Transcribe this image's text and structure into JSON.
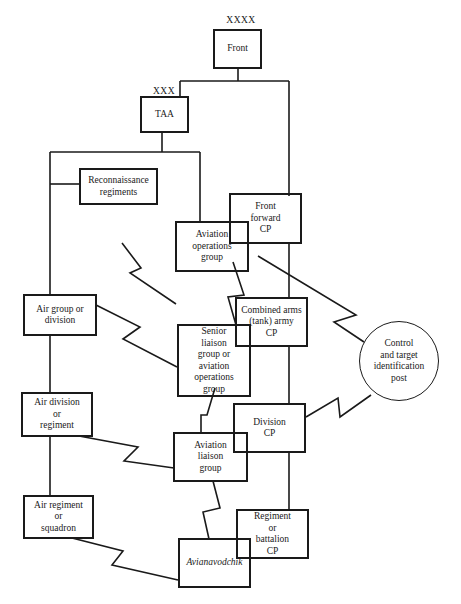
{
  "diagram": {
    "type": "organizational/communication diagram",
    "echelons": {
      "front": "XXXX",
      "taa": "XXX"
    },
    "nodes": {
      "front": "Front",
      "taa": "TAA",
      "recon": "Reconnaissance regiments",
      "aog": "Aviation operations group",
      "ffcp": "Front forward CP",
      "air_group": "Air group or division",
      "senior_liaison": "Senior liaison group or aviation operations group",
      "cacp": "Combined arms (tank) army CP",
      "ctip": "Control and target identification post",
      "air_div": "Air division or regiment",
      "alg": "Aviation liaison group",
      "div_cp": "Division CP",
      "air_reg": "Air regiment or squadron",
      "reg_cp": "Regiment or battalion CP",
      "avianavodchik": "Avianavodchik"
    },
    "line_lines": {
      "recon": [
        "Reconnaissance",
        "regiments"
      ],
      "aog": [
        "Aviation",
        "operations",
        "group"
      ],
      "ffcp": [
        "Front",
        "forward",
        "CP"
      ],
      "air_group": [
        "Air group or",
        "division"
      ],
      "senior_liaison": [
        "Senior",
        "liaison",
        "group or",
        "aviation",
        "operations",
        "group"
      ],
      "cacp": [
        "Combined arms",
        "(tank) army",
        "CP"
      ],
      "ctip": [
        "Control",
        "and target",
        "identification",
        "post"
      ],
      "air_div": [
        "Air division",
        "or",
        "regiment"
      ],
      "alg": [
        "Aviation",
        "liaison",
        "group"
      ],
      "div_cp": [
        "Division",
        "CP"
      ],
      "air_reg": [
        "Air regiment",
        "or",
        "squadron"
      ],
      "reg_cp": [
        "Regiment",
        "or",
        "battalion",
        "CP"
      ]
    },
    "link_legend": {
      "solid": "command link",
      "zigzag": "radio link"
    }
  }
}
